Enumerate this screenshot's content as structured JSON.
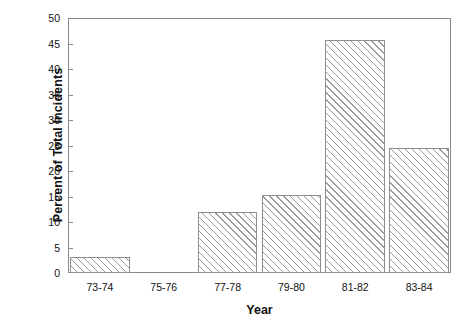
{
  "chart_data": {
    "type": "bar",
    "title": "",
    "xlabel": "Year",
    "ylabel": "Percent of Total Incidents",
    "categories": [
      "73-74",
      "75-76",
      "77-78",
      "79-80",
      "81-82",
      "83-84"
    ],
    "values": [
      3.2,
      0,
      12.0,
      15.2,
      45.7,
      24.5
    ],
    "ylim": [
      0,
      50
    ],
    "ytick_labels": [
      "50",
      "45",
      "40",
      "35",
      "30",
      "25",
      "20",
      "15",
      "10",
      "5",
      "0"
    ],
    "ytick_values": [
      50,
      45,
      40,
      35,
      30,
      25,
      20,
      15,
      10,
      5,
      0
    ],
    "grid": false,
    "legend": false,
    "bar_fill": "hatched-diagonal",
    "bar_edge_color": "#8f8f8f",
    "axis_color": "#8a8a8a",
    "background_color": "#ffffff"
  }
}
